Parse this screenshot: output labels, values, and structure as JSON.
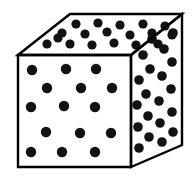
{
  "figure": {
    "description": "Black and white line drawing of a three-dimensional cube shown in oblique projection with black dots distributed across the three visible faces.",
    "background_color": "#ffffff",
    "line_color": "#000000",
    "dot_color": "#121212",
    "line_width": 2.4,
    "canvas": {
      "width": 194,
      "height": 185
    }
  },
  "geometry": {
    "vertices": {
      "front_top_left": {
        "x": 18,
        "y": 55,
        "label": "front-top-left"
      },
      "front_top_right": {
        "x": 131,
        "y": 55,
        "label": "front-top-right"
      },
      "front_bottom_right": {
        "x": 131,
        "y": 167,
        "label": "front-bottom-right"
      },
      "front_bottom_left": {
        "x": 18,
        "y": 167,
        "label": "front-bottom-left"
      },
      "back_top_left": {
        "x": 70,
        "y": 14,
        "label": "back-top-left"
      },
      "back_top_right": {
        "x": 182,
        "y": 14,
        "label": "back-top-right"
      },
      "back_bottom_right": {
        "x": 182,
        "y": 145,
        "label": "back-bottom-right"
      }
    },
    "faces": {
      "front": {
        "name": "front-face",
        "points": "18,55 131,55 131,167 18,167"
      },
      "top": {
        "name": "top-face",
        "points": "18,55 70,14 182,14 131,55"
      },
      "right": {
        "name": "right-face",
        "points": "131,55 182,14 182,145 131,167"
      }
    }
  },
  "dots": {
    "radius_front": 5.2,
    "radius_top": 4.6,
    "radius_right": 4.8,
    "count_front": 15,
    "count_top": 18,
    "count_right": 20,
    "count_total": 53,
    "front": [
      {
        "cx": 32,
        "cy": 70
      },
      {
        "cx": 66,
        "cy": 69
      },
      {
        "cx": 96,
        "cy": 69
      },
      {
        "cx": 47,
        "cy": 88
      },
      {
        "cx": 81,
        "cy": 88
      },
      {
        "cx": 112,
        "cy": 88
      },
      {
        "cx": 31,
        "cy": 107
      },
      {
        "cx": 64,
        "cy": 106
      },
      {
        "cx": 95,
        "cy": 107
      },
      {
        "cx": 46,
        "cy": 132
      },
      {
        "cx": 80,
        "cy": 133
      },
      {
        "cx": 111,
        "cy": 133
      },
      {
        "cx": 31,
        "cy": 152
      },
      {
        "cx": 62,
        "cy": 152
      },
      {
        "cx": 95,
        "cy": 152
      }
    ],
    "top": [
      {
        "cx": 76,
        "cy": 24
      },
      {
        "cx": 98,
        "cy": 23
      },
      {
        "cx": 120,
        "cy": 25
      },
      {
        "cx": 143,
        "cy": 24
      },
      {
        "cx": 165,
        "cy": 26
      },
      {
        "cx": 62,
        "cy": 33
      },
      {
        "cx": 85,
        "cy": 34
      },
      {
        "cx": 107,
        "cy": 32
      },
      {
        "cx": 130,
        "cy": 35
      },
      {
        "cx": 152,
        "cy": 33
      },
      {
        "cx": 172,
        "cy": 35
      },
      {
        "cx": 47,
        "cy": 44
      },
      {
        "cx": 70,
        "cy": 44
      },
      {
        "cx": 92,
        "cy": 45
      },
      {
        "cx": 114,
        "cy": 43
      },
      {
        "cx": 136,
        "cy": 45
      },
      {
        "cx": 58,
        "cy": 38
      },
      {
        "cx": 158,
        "cy": 44
      }
    ],
    "right": [
      {
        "cx": 152,
        "cy": 39
      },
      {
        "cx": 173,
        "cy": 33
      },
      {
        "cx": 143,
        "cy": 55
      },
      {
        "cx": 164,
        "cy": 49
      },
      {
        "cx": 150,
        "cy": 69
      },
      {
        "cx": 172,
        "cy": 62
      },
      {
        "cx": 139,
        "cy": 80
      },
      {
        "cx": 162,
        "cy": 76
      },
      {
        "cx": 146,
        "cy": 94
      },
      {
        "cx": 171,
        "cy": 89
      },
      {
        "cx": 137,
        "cy": 105
      },
      {
        "cx": 159,
        "cy": 101
      },
      {
        "cx": 148,
        "cy": 116
      },
      {
        "cx": 172,
        "cy": 112
      },
      {
        "cx": 138,
        "cy": 127
      },
      {
        "cx": 160,
        "cy": 123
      },
      {
        "cx": 149,
        "cy": 137
      },
      {
        "cx": 173,
        "cy": 132
      },
      {
        "cx": 139,
        "cy": 148
      },
      {
        "cx": 162,
        "cy": 142
      }
    ]
  }
}
